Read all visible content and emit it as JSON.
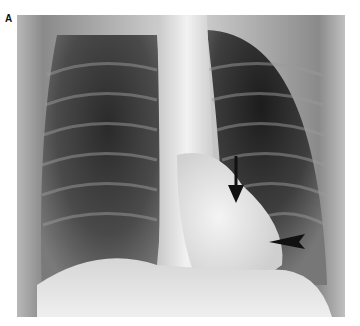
{
  "figure": {
    "panel_label": "A",
    "image_description": "Frontal chest radiograph",
    "annotations": [
      {
        "type": "arrow",
        "direction": "down",
        "description": "black arrow pointing down at left cardiac border"
      },
      {
        "type": "arrowhead",
        "direction": "left",
        "description": "black arrowhead pointing left at lower left cardiac border"
      }
    ]
  }
}
